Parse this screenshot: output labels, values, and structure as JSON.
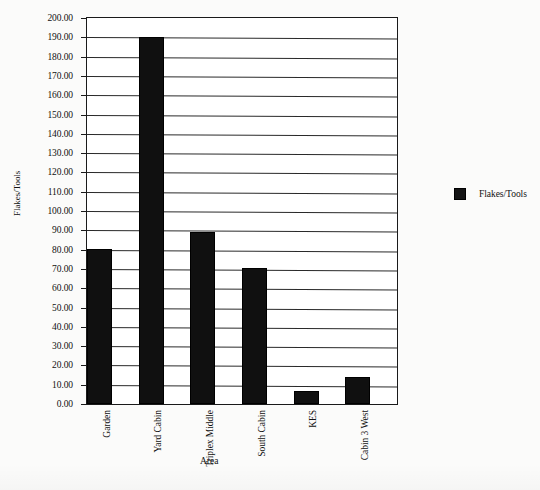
{
  "chart_data": {
    "type": "bar",
    "title": "",
    "xlabel": "Area",
    "ylabel": "Flakes/Tools",
    "categories": [
      "Garden",
      "Yard Cabin",
      "Triplex Middle",
      "South Cabin",
      "KES",
      "Cabin 3 West"
    ],
    "values": [
      80.5,
      190.0,
      89.0,
      70.5,
      7.0,
      14.0
    ],
    "series": [
      {
        "name": "Flakes/Tools",
        "values": [
          80.5,
          190.0,
          89.0,
          70.5,
          7.0,
          14.0
        ],
        "color": "#101010"
      }
    ],
    "ylim": [
      0,
      200
    ],
    "ytick_step": 10,
    "ytick_labels": [
      "200.00",
      "190.00",
      "180.00",
      "170.00",
      "160.00",
      "150.00",
      "140.00",
      "130.00",
      "120.00",
      "110.00",
      "100.00",
      "90.00",
      "80.00",
      "70.00",
      "60.00",
      "50.00",
      "40.00",
      "30.00",
      "20.00",
      "10.00",
      "0.00"
    ],
    "grid": true,
    "grid_axis": "y",
    "legend": {
      "position": "right",
      "entries": [
        {
          "label": "Flakes/Tools",
          "color": "#101010",
          "swatch": "filled-square-icon"
        }
      ]
    }
  }
}
